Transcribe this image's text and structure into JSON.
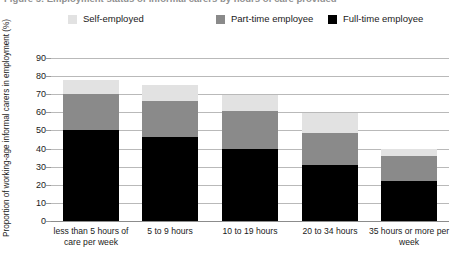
{
  "figure": {
    "truncated_title": "Figure 5: Employment status of informal carers by hours of care provided",
    "y_axis_title": "Proportion of working-age informal carers in employment (%)"
  },
  "legend": {
    "items": [
      {
        "label": "Self-employed",
        "color": "#e2e2e2",
        "swatch_name": "legend-swatch-self-employed"
      },
      {
        "label": "Part-time employee",
        "color": "#8a8a8a",
        "swatch_name": "legend-swatch-part-time"
      },
      {
        "label": "Full-time employee",
        "color": "#000000",
        "swatch_name": "legend-swatch-full-time"
      }
    ]
  },
  "chart_data": {
    "type": "bar",
    "subtype": "stacked-vertical",
    "title": "",
    "xlabel": "",
    "ylabel": "Proportion of working-age informal carers in employment (%)",
    "ylim": [
      0,
      90
    ],
    "ytick_labels": [
      "0",
      "10",
      "20",
      "30",
      "40",
      "50",
      "60",
      "70",
      "80",
      "90"
    ],
    "yticks": [
      0,
      10,
      20,
      30,
      40,
      50,
      60,
      70,
      80,
      90
    ],
    "grid": true,
    "legend_position": "top",
    "categories": [
      "less than 5 hours of care per week",
      "5 to 9 hours",
      "10 to 19 hours",
      "20 to 34 hours",
      "35 hours or more per week"
    ],
    "series": [
      {
        "name": "Full-time employee",
        "color": "#000000",
        "values": [
          50,
          46.5,
          40,
          31,
          22
        ]
      },
      {
        "name": "Part-time employee",
        "color": "#8a8a8a",
        "values": [
          20,
          19.5,
          20.5,
          17.5,
          14
        ]
      },
      {
        "name": "Self-employed",
        "color": "#e2e2e2",
        "values": [
          8,
          9,
          9,
          11,
          4
        ]
      }
    ],
    "totals": [
      78,
      75,
      69.5,
      59.5,
      40
    ]
  }
}
